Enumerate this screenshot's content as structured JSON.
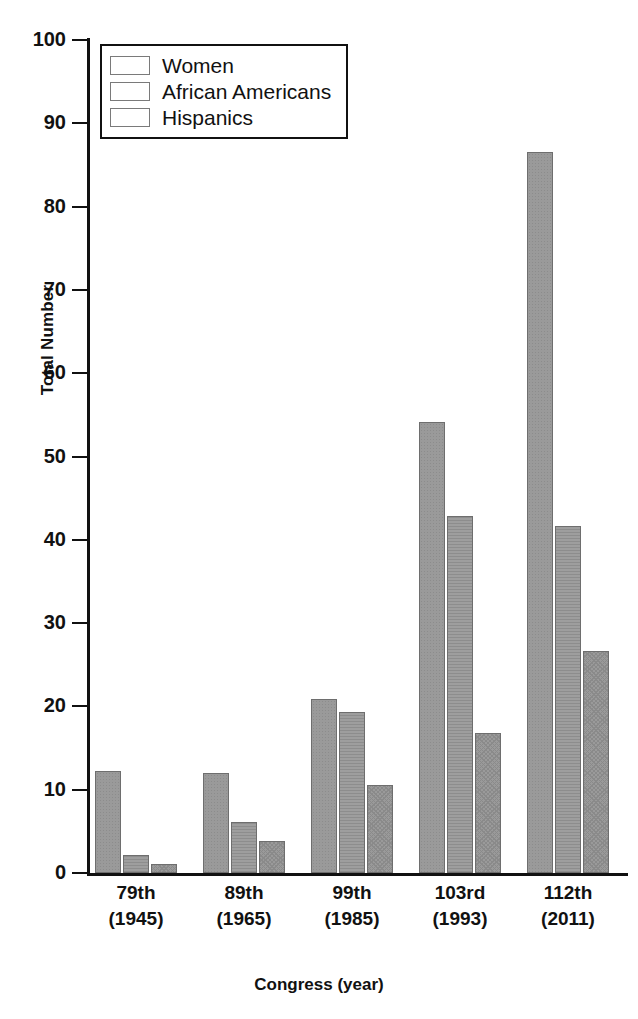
{
  "chart_data": {
    "type": "bar",
    "title": "",
    "xlabel": "Congress (year)",
    "ylabel": "Total Number",
    "ylim": [
      0,
      100
    ],
    "ytick_step": 10,
    "yticks": [
      100,
      90,
      80,
      70,
      60,
      50,
      40,
      30,
      20,
      10,
      0
    ],
    "grid": false,
    "legend_position": "top-left",
    "categories": [
      "79th\n(1945)",
      "89th\n(1965)",
      "99th\n(1985)",
      "103rd\n(1993)",
      "112th\n(2011)"
    ],
    "category_lines": [
      {
        "line1": "79th",
        "line2": "(1945)"
      },
      {
        "line1": "89th",
        "line2": "(1965)"
      },
      {
        "line1": "99th",
        "line2": "(1985)"
      },
      {
        "line1": "103rd",
        "line2": "(1993)"
      },
      {
        "line1": "112th",
        "line2": "(2011)"
      }
    ],
    "series": [
      {
        "name": "Women",
        "values": [
          12.2,
          12.0,
          20.9,
          54.2,
          86.6
        ],
        "color": "#9a9a9a",
        "pattern": "dots"
      },
      {
        "name": "African Americans",
        "values": [
          2.2,
          6.1,
          19.3,
          42.8,
          41.7
        ],
        "color": "#9e9e9e",
        "pattern": "hlines"
      },
      {
        "name": "Hispanics",
        "values": [
          1.1,
          3.9,
          10.6,
          16.8,
          26.7
        ],
        "color": "#9a9a9a",
        "pattern": "crosshatch"
      }
    ]
  },
  "axes": {
    "y_title": "Total Number",
    "x_title": "Congress (year)",
    "y_tick_labels": [
      "100",
      "90",
      "80",
      "70",
      "60",
      "50",
      "40",
      "30",
      "20",
      "10",
      "0"
    ]
  },
  "legend": {
    "items": [
      {
        "label": "Women"
      },
      {
        "label": "African Americans"
      },
      {
        "label": "Hispanics"
      }
    ]
  },
  "scan": {
    "top_remnant": "",
    "smudge": ""
  }
}
